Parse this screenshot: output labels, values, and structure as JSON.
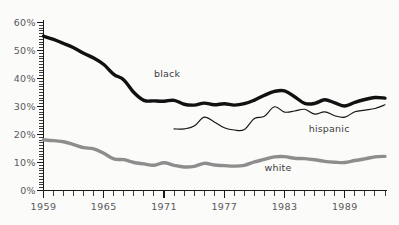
{
  "chart_data": {
    "type": "line",
    "title": "",
    "subtitle": "",
    "xlabel": "",
    "ylabel": "",
    "xlim": [
      1959,
      1993
    ],
    "ylim": [
      0,
      60
    ],
    "grid": false,
    "legend_position": "inline-annotations",
    "y_tick_labels": [
      "60%",
      "50%",
      "40%",
      "30%",
      "20%",
      "10%",
      "0%"
    ],
    "y_tick_values": [
      60,
      50,
      40,
      30,
      20,
      10,
      0
    ],
    "y_minor_tick_step": 1,
    "x_tick_labels": [
      "1959",
      "1965",
      "1971",
      "1977",
      "1983",
      "1989"
    ],
    "x_tick_label_values": [
      1959,
      1965,
      1971,
      1977,
      1983,
      1989
    ],
    "x_minor_tick_step": 1,
    "x_values": [
      1959,
      1960,
      1961,
      1962,
      1963,
      1964,
      1965,
      1966,
      1967,
      1968,
      1969,
      1970,
      1971,
      1972,
      1973,
      1974,
      1975,
      1976,
      1977,
      1978,
      1979,
      1980,
      1981,
      1982,
      1983,
      1984,
      1985,
      1986,
      1987,
      1988,
      1989,
      1990,
      1991,
      1992,
      1993
    ],
    "series": [
      {
        "name": "black",
        "label": "black",
        "color": "#111111",
        "style": "thick-black",
        "x": [
          1959,
          1960,
          1961,
          1962,
          1963,
          1964,
          1965,
          1966,
          1967,
          1968,
          1969,
          1970,
          1971,
          1972,
          1973,
          1974,
          1975,
          1976,
          1977,
          1978,
          1979,
          1980,
          1981,
          1982,
          1983,
          1984,
          1985,
          1986,
          1987,
          1988,
          1989,
          1990,
          1991,
          1992,
          1993
        ],
        "values": [
          55.1,
          54.0,
          52.5,
          51.0,
          49.0,
          47.3,
          45.0,
          41.5,
          39.5,
          35.0,
          32.2,
          32.0,
          31.9,
          32.2,
          30.8,
          30.5,
          31.2,
          30.6,
          31.0,
          30.5,
          31.0,
          32.3,
          34.0,
          35.4,
          35.6,
          33.5,
          31.1,
          31.1,
          32.4,
          31.3,
          30.2,
          31.5,
          32.5,
          33.2,
          33.0
        ]
      },
      {
        "name": "hispanic",
        "label": "hispanic",
        "color": "#151515",
        "style": "thin-black",
        "x": [
          1972,
          1973,
          1974,
          1975,
          1976,
          1977,
          1978,
          1979,
          1980,
          1981,
          1982,
          1983,
          1984,
          1985,
          1986,
          1987,
          1988,
          1989,
          1990,
          1991,
          1992,
          1993
        ],
        "values": [
          22.0,
          22.0,
          23.0,
          26.2,
          24.5,
          22.4,
          21.6,
          21.8,
          25.7,
          26.5,
          29.9,
          28.0,
          28.4,
          29.0,
          27.3,
          28.1,
          26.7,
          26.2,
          28.1,
          28.7,
          29.3,
          30.6
        ]
      },
      {
        "name": "white",
        "label": "white",
        "color": "#8d8d8d",
        "style": "thick-gray",
        "x": [
          1959,
          1960,
          1961,
          1962,
          1963,
          1964,
          1965,
          1966,
          1967,
          1968,
          1969,
          1970,
          1971,
          1972,
          1973,
          1974,
          1975,
          1976,
          1977,
          1978,
          1979,
          1980,
          1981,
          1982,
          1983,
          1984,
          1985,
          1986,
          1987,
          1988,
          1989,
          1990,
          1991,
          1992,
          1993
        ],
        "values": [
          18.1,
          17.8,
          17.4,
          16.4,
          15.3,
          14.9,
          13.3,
          11.3,
          11.0,
          10.0,
          9.5,
          9.0,
          9.9,
          9.0,
          8.4,
          8.6,
          9.7,
          9.1,
          8.9,
          8.7,
          9.0,
          10.2,
          11.1,
          12.0,
          12.1,
          11.5,
          11.4,
          11.0,
          10.4,
          10.1,
          10.0,
          10.7,
          11.3,
          12.0,
          12.2
        ]
      }
    ],
    "annotations": [
      {
        "name": "black",
        "text": "black",
        "x": 1970.0,
        "y": 40.5
      },
      {
        "name": "hispanic",
        "text": "hispanic",
        "x": 1985.4,
        "y": 20.8
      },
      {
        "name": "white",
        "text": "white",
        "x": 1981.0,
        "y": 6.8
      }
    ],
    "colors": {
      "black_series": "#111111",
      "hispanic_series": "#151515",
      "white_series": "#8d8d8d",
      "axis": "#1a1a1a",
      "tick_label": "#58585a",
      "background": "#fbfbfa"
    }
  }
}
